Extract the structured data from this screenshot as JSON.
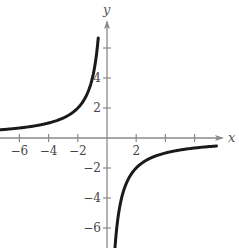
{
  "chart_data": {
    "type": "line",
    "title": "",
    "function": "y = -4/x",
    "xlabel": "x",
    "ylabel": "y",
    "xlim": [
      -7.3,
      8.5
    ],
    "ylim": [
      -7.3,
      7.8
    ],
    "grid": false,
    "legend": null,
    "x_ticks": [
      -6,
      -4,
      -2,
      2,
      4,
      6
    ],
    "x_tick_labels": [
      "-6",
      "-4",
      "-2",
      "2",
      "",
      ""
    ],
    "y_ticks": [
      -6,
      -4,
      -2,
      2,
      4,
      6
    ],
    "y_tick_labels": [
      "-6",
      "-4",
      "-2",
      "2",
      "4",
      ""
    ],
    "series": [
      {
        "name": "left branch",
        "x": [
          -7.3,
          -6,
          -5,
          -4,
          -3,
          -2,
          -1.5,
          -1,
          -0.75,
          -0.6
        ],
        "y": [
          0.55,
          0.67,
          0.8,
          1.0,
          1.33,
          2.0,
          2.67,
          4.0,
          5.33,
          6.67
        ]
      },
      {
        "name": "right branch",
        "x": [
          0.55,
          0.75,
          1,
          1.5,
          2,
          3,
          4,
          5,
          6,
          7.5
        ],
        "y": [
          -7.3,
          -5.33,
          -4.0,
          -2.67,
          -2.0,
          -1.33,
          -1.0,
          -0.8,
          -0.67,
          -0.53
        ]
      }
    ],
    "asymptotes": {
      "vertical": 0,
      "horizontal": 0
    },
    "colors": {
      "curve": "#1a1a1a",
      "axis": "#8a8a8a",
      "text": "#444444"
    }
  }
}
